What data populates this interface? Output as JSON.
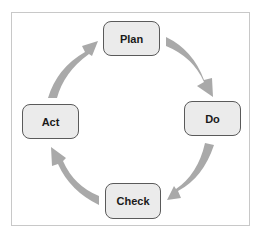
{
  "diagram": {
    "type": "cycle",
    "title": "",
    "nodes": [
      {
        "id": "plan",
        "label": "Plan"
      },
      {
        "id": "do",
        "label": "Do"
      },
      {
        "id": "check",
        "label": "Check"
      },
      {
        "id": "act",
        "label": "Act"
      }
    ],
    "edges": [
      {
        "from": "plan",
        "to": "do"
      },
      {
        "from": "do",
        "to": "check"
      },
      {
        "from": "check",
        "to": "act"
      },
      {
        "from": "act",
        "to": "plan"
      }
    ],
    "colors": {
      "node_fill": "#ebebeb",
      "node_border": "#5a5a5a",
      "arrow": "#a9a9a9",
      "frame_border": "#c8c8c8"
    }
  }
}
